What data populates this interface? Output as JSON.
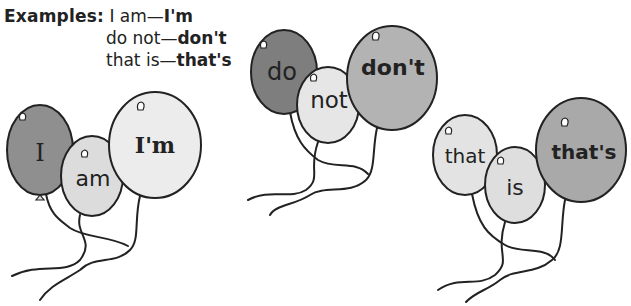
{
  "examples": {
    "label": "Examples:",
    "items": [
      {
        "words": "I am",
        "dash": "—",
        "contraction": "I'm"
      },
      {
        "words": "do not",
        "dash": "—",
        "contraction": "don't"
      },
      {
        "words": "that is",
        "dash": "—",
        "contraction": "that's"
      }
    ]
  },
  "balloon_groups": [
    {
      "name": "i-am",
      "balloons": [
        {
          "text": "I",
          "fill": "#8f8f8f",
          "role": "word1"
        },
        {
          "text": "am",
          "fill": "#dcdcdc",
          "role": "word2"
        },
        {
          "text": "I'm",
          "fill": "#ececec",
          "role": "contraction"
        }
      ]
    },
    {
      "name": "do-not",
      "balloons": [
        {
          "text": "do",
          "fill": "#7e7e7e",
          "role": "word1"
        },
        {
          "text": "not",
          "fill": "#e6e6e6",
          "role": "word2"
        },
        {
          "text": "don't",
          "fill": "#b3b3b3",
          "role": "contraction"
        }
      ]
    },
    {
      "name": "that-is",
      "balloons": [
        {
          "text": "that",
          "fill": "#e3e3e3",
          "role": "word1"
        },
        {
          "text": "is",
          "fill": "#dedede",
          "role": "word2"
        },
        {
          "text": "that's",
          "fill": "#a9a9a9",
          "role": "contraction"
        }
      ]
    }
  ],
  "colors": {
    "outline": "#222222",
    "text": "#222222",
    "background": "#ffffff"
  }
}
